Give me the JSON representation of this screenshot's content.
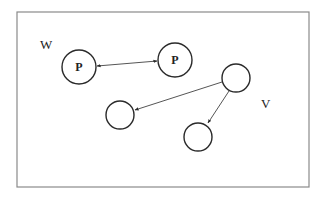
{
  "diagram": {
    "labels": {
      "region_w": "W",
      "region_v": "V"
    },
    "nodes": [
      {
        "id": "p1",
        "label": "P",
        "cx": 79,
        "cy": 67,
        "r": 17
      },
      {
        "id": "p2",
        "label": "P",
        "cx": 175,
        "cy": 60,
        "r": 17
      },
      {
        "id": "source",
        "label": "",
        "cx": 236,
        "cy": 78,
        "r": 14
      },
      {
        "id": "target-left",
        "label": "",
        "cx": 120,
        "cy": 115,
        "r": 14
      },
      {
        "id": "target-bottom",
        "label": "",
        "cx": 198,
        "cy": 137,
        "r": 14
      }
    ],
    "edges": [
      {
        "from": "p1",
        "to": "p2",
        "type": "bidirectional"
      },
      {
        "from": "source",
        "to": "target-left",
        "type": "directed"
      },
      {
        "from": "source",
        "to": "target-bottom",
        "type": "directed"
      }
    ],
    "colors": {
      "stroke": "#2a2a2a",
      "border": "#8a8a8a",
      "background": "#ffffff"
    }
  }
}
